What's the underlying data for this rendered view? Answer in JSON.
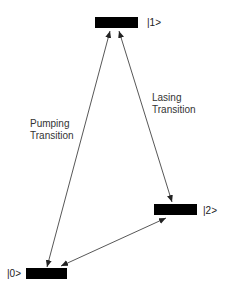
{
  "diagram": {
    "type": "energy-level-diagram",
    "levels": [
      {
        "id": "level-1",
        "label": "|1>"
      },
      {
        "id": "level-2",
        "label": "|2>"
      },
      {
        "id": "level-0",
        "label": "|0>"
      }
    ],
    "transitions": [
      {
        "id": "pumping",
        "line1": "Pumping",
        "line2": "Transition",
        "from": "|0>",
        "to": "|1>"
      },
      {
        "id": "lasing",
        "line1": "Lasing",
        "line2": "Transition",
        "from": "|1>",
        "to": "|2>"
      },
      {
        "id": "relaxation",
        "from": "|2>",
        "to": "|0>"
      }
    ],
    "colors": {
      "bar": "#000000",
      "line": "#444444",
      "text": "#222222"
    }
  }
}
